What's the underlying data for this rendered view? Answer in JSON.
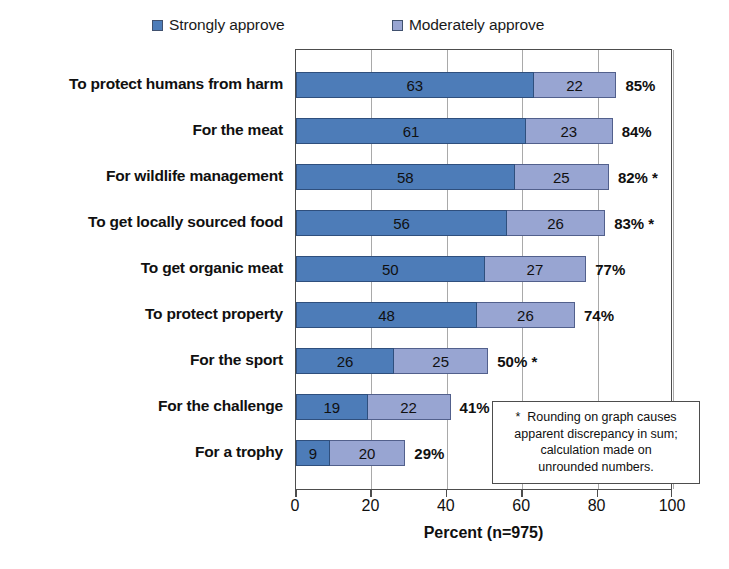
{
  "chart_data": {
    "type": "bar",
    "orientation": "horizontal",
    "stacked": true,
    "title": "",
    "xlabel": "Percent (n=975)",
    "ylabel": "",
    "xlim": [
      0,
      100
    ],
    "xticks": [
      0,
      20,
      40,
      60,
      80,
      100
    ],
    "grid": true,
    "legend_position": "top",
    "categories": [
      "To protect humans from harm",
      "For the meat",
      "For wildlife management",
      "To get locally sourced food",
      "To get organic meat",
      "To protect property",
      "For the sport",
      "For the challenge",
      "For a trophy"
    ],
    "series": [
      {
        "name": "Strongly approve",
        "color": "#4d7cb8",
        "values": [
          63,
          61,
          58,
          56,
          50,
          48,
          26,
          19,
          9
        ]
      },
      {
        "name": "Moderately approve",
        "color": "#98a5d2",
        "values": [
          22,
          23,
          25,
          26,
          27,
          26,
          25,
          22,
          20
        ]
      }
    ],
    "totals": [
      {
        "label": "85%",
        "value": 85,
        "footnote_mark": ""
      },
      {
        "label": "84%",
        "value": 84,
        "footnote_mark": ""
      },
      {
        "label": "82%",
        "value": 82,
        "footnote_mark": "*"
      },
      {
        "label": "83%",
        "value": 83,
        "footnote_mark": "*"
      },
      {
        "label": "77%",
        "value": 77,
        "footnote_mark": ""
      },
      {
        "label": "74%",
        "value": 74,
        "footnote_mark": ""
      },
      {
        "label": "50%",
        "value": 50,
        "footnote_mark": "*"
      },
      {
        "label": "41%",
        "value": 41,
        "footnote_mark": ""
      },
      {
        "label": "29%",
        "value": 29,
        "footnote_mark": ""
      }
    ],
    "annotations": [
      "* Rounding on graph causes apparent discrepancy in sum; calculation made on unrounded numbers."
    ]
  },
  "legend": {
    "entries": [
      {
        "label": "Strongly approve",
        "color": "#4d7cb8"
      },
      {
        "label": "Moderately approve",
        "color": "#98a5d2"
      }
    ]
  },
  "axis": {
    "title": "Percent (n=975)",
    "tick_labels": [
      "0",
      "20",
      "40",
      "60",
      "80",
      "100"
    ]
  },
  "footnote": {
    "marker": "*",
    "line1": "Rounding on graph causes",
    "line2": "apparent discrepancy in sum;",
    "line3": "calculation made on",
    "line4": "unrounded numbers."
  }
}
